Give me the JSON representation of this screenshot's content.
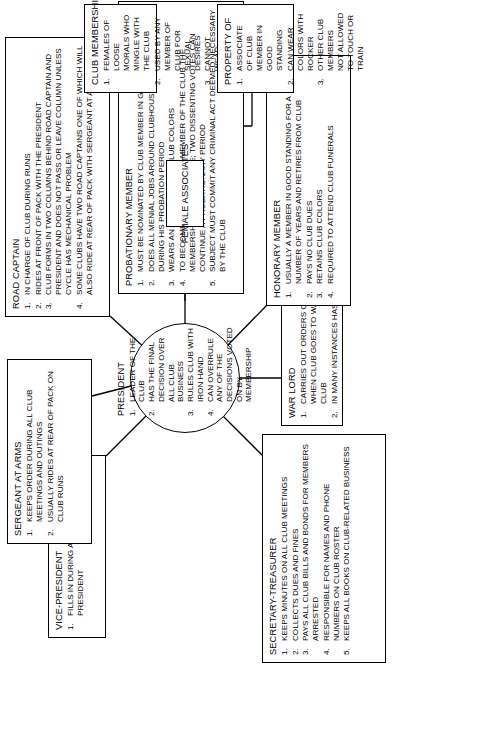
{
  "diagram": {
    "type": "organizational-hierarchy",
    "orientation": "rotated-90-ccw",
    "center": {
      "title": "PRESIDENT",
      "items": [
        "LEADER OF THE CLUB",
        "HAS THE FINAL DECISION OVER ALL CLUB BUSINESS",
        "RULES CLUB WITH IRON HAND",
        "CAN OVERRULE ANY OF THE DECISIONS VOTED ON BY MEMBERSHIP"
      ]
    },
    "nodes": [
      {
        "id": "sergeant-at-arms",
        "title": "SERGEANT AT ARMS",
        "items": [
          "KEEPS ORDER DURING ALL CLUB MEETINGS AND OUTINGS",
          "USUALLY RIDES AT REAR OF PACK ON CLUB RUNS"
        ]
      },
      {
        "id": "road-captain",
        "title": "ROAD CAPTAIN",
        "items": [
          "IN CHARGE OF CLUB DURING RUNS",
          "RIDES AT FRONT OF PACK WITH THE PRESIDENT",
          "CLUB FORMS IN TWO COLUMNS BEHIND ROAD CAPTAIN AND PRESIDENT AND DOES NOT PASS OR LEAVE COLUMN UNLESS CYCLE HAS MECHANICAL PROBLEM",
          "SOME CLUBS HAVE TWO ROAD CAPTAINS ONE OF WHICH WILL ALSO RIDE AT REAR OF PACK WITH SERGEANT AT ARMS"
        ]
      },
      {
        "id": "probationary-member",
        "title": "PROBATIONARY MEMBER",
        "items": [
          "MUST BE NOMINATED BY CLUB MEMBER IN GOOD STANDING",
          "DOES ALL MENIAL JOBS AROUND CLUBHOUSE AND ON RUNS DURING HIS PROBATION PERIOD",
          "WEARS AN ARM BAND; NO CLUB COLORS",
          "TO BECOME FULL-FLEDGED MEMBER OF THE CLUB THE MEMBERSHIP CASTS A VOTE; TWO DISSENTING VOTES CAN CONTINUE A PROBATIONARY PERIOD",
          "SUBJECT MUST COMMIT ANY CRIMINAL ACT DEEMED NECESSARY BY THE CLUB"
        ]
      },
      {
        "id": "vice-president",
        "title": "VICE-PRESIDENT",
        "items": [
          "FILLS IN DURING ABSENCE OF THE PRESIDENT"
        ]
      },
      {
        "id": "secretary-treasurer",
        "title": "SECRETARY-TREASURER",
        "items": [
          "KEEPS MINUTES ON ALL CLUB MEETINGS",
          "COLLECTS DUES AND FINES",
          "PAYS ALL CLUB BILLS AND BONDS FOR MEMBERS ARRESTED",
          "RESPONSIBLE FOR NAMES AND PHONE NUMBERS ON CLUB ROSTER",
          "KEEPS ALL BOOKS ON CLUB-RELATED BUSINESS"
        ]
      },
      {
        "id": "war-lord",
        "title": "WAR LORD",
        "items": [
          "CARRIES OUT ORDERS OF THE PRESIDENT WHEN CLUB GOES TO WAR WITH ANOTHER CLUB",
          "IN MANY INSTANCES HAS THE CLUB'S ARSENAL"
        ]
      },
      {
        "id": "honorary-member",
        "title": "HONORARY MEMBER",
        "items": [
          "USUALLY A MEMBER IN GOOD STANDING FOR A NUMBER OF YEARS AND RETIRES FROM CLUB",
          "PAYS NO CLUB DUES",
          "RETAINS CLUB COLORS",
          "REQUIRED TO ATTEND CLUB FUNERALS"
        ]
      },
      {
        "id": "female-associates",
        "title": "FEMALE ASSOCIATES",
        "items": []
      },
      {
        "id": "club-membership",
        "title": "CLUB MEMBERSHIP",
        "items": [
          "FEMALES OF LOOSE MORALS WHO MINGLE WITH THE CLUB",
          "USED BY ANY MEMBER OF CLUB FOR SEXUAL DESIRES",
          "CANNOT WEAR COLORS"
        ]
      },
      {
        "id": "property-of",
        "title": "PROPERTY OF",
        "items": [
          "ASSOCIATE OF CLUB MEMBER IN GOOD STANDING",
          "CAN WEAR COLORS WITH ROCKER",
          "OTHER CLUB MEMBERS NOT ALLOWED TO TOUCH OR TRAIN"
        ]
      }
    ],
    "colors": {
      "stroke": "#000000",
      "background": "#ffffff",
      "text": "#000000"
    }
  }
}
